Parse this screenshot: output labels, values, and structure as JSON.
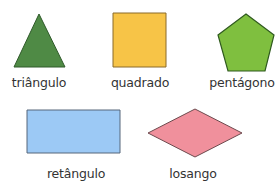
{
  "figure": {
    "shapes": [
      {
        "id": "triangle",
        "label": "triângulo",
        "fill": "#4f8a45",
        "stroke": "#2f5a2a",
        "points": "39,14 65,67 14,67",
        "label_x": 39,
        "label_y": 76
      },
      {
        "id": "square",
        "label": "quadrado",
        "fill": "#f7c447",
        "stroke": "#8a6a2a",
        "points": "113,13 166,13 166,67 113,67",
        "label_x": 140,
        "label_y": 76
      },
      {
        "id": "pentagon",
        "label": "pentágono",
        "fill": "#7fbf3f",
        "stroke": "#2f5a1e",
        "points": "246,14 274,35 265,71 228,71 218,35",
        "label_x": 242,
        "label_y": 76
      },
      {
        "id": "rectangle",
        "label": "retângulo",
        "fill": "#9cc9f5",
        "stroke": "#56677a",
        "points": "27,110 120,110 120,153 27,153",
        "label_x": 76,
        "label_y": 167
      },
      {
        "id": "rhombus",
        "label": "losango",
        "fill": "#f0909c",
        "stroke": "#6d4a4e",
        "points": "148,133 195,109 242,133 195,157",
        "label_x": 193,
        "label_y": 167
      }
    ]
  }
}
